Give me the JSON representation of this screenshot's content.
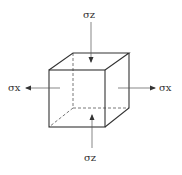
{
  "diagram": {
    "type": "stress-element-cube",
    "labels": {
      "top": "σz",
      "bottom": "σz",
      "left": "σx",
      "right": "σx"
    },
    "colors": {
      "stroke": "#333333",
      "arrow": "#555555",
      "background": "#ffffff"
    }
  }
}
